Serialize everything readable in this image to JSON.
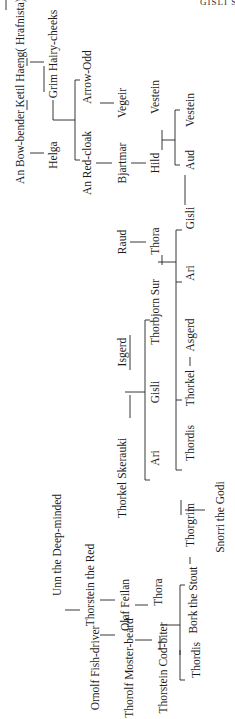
{
  "header": {
    "running_head": "GISLI SURSSON'S"
  },
  "people": [
    {
      "id": "an-bow-bender",
      "name": "An Bow-bender",
      "x": 20,
      "y": 147
    },
    {
      "id": "ketil-haeng",
      "name": "Ketil Haeng( Hrafnista)",
      "x": 20,
      "y": 53
    },
    {
      "id": "helga",
      "name": "Helga",
      "x": 53,
      "y": 155
    },
    {
      "id": "grim-hairy-cheeks",
      "name": "Grim Hairy-cheeks",
      "x": 53,
      "y": 54
    },
    {
      "id": "arrow-odd",
      "name": "Arrow-Odd",
      "x": 87,
      "y": 77
    },
    {
      "id": "an-red-cloak",
      "name": "An Red-cloak",
      "x": 87,
      "y": 163
    },
    {
      "id": "vegeir",
      "name": "Vegeir",
      "x": 122,
      "y": 103
    },
    {
      "id": "bjartmar",
      "name": "Bjartmar",
      "x": 122,
      "y": 163
    },
    {
      "id": "vestein-1",
      "name": "Vestein",
      "x": 155,
      "y": 97
    },
    {
      "id": "hild",
      "name": "Hild",
      "x": 155,
      "y": 163
    },
    {
      "id": "vestein-2",
      "name": "Vestein",
      "x": 190,
      "y": 110
    },
    {
      "id": "aud",
      "name": "Aud",
      "x": 190,
      "y": 160
    },
    {
      "id": "gisli-1",
      "name": "Gisli",
      "x": 190,
      "y": 218
    },
    {
      "id": "raud",
      "name": "Raud",
      "x": 122,
      "y": 242
    },
    {
      "id": "thora-1",
      "name": "Thora",
      "x": 155,
      "y": 241
    },
    {
      "id": "thorbjorn-sur",
      "name": "Thorbjorn Sur",
      "x": 155,
      "y": 312
    },
    {
      "id": "ari-1",
      "name": "Ari",
      "x": 190,
      "y": 273
    },
    {
      "id": "isgerd",
      "name": "Isgerd",
      "x": 122,
      "y": 352
    },
    {
      "id": "gisli-2",
      "name": "Gisli",
      "x": 155,
      "y": 392
    },
    {
      "id": "asgerd",
      "name": "Asgerd",
      "x": 190,
      "y": 335
    },
    {
      "id": "thorkel",
      "name": "Thorkel",
      "x": 190,
      "y": 388
    },
    {
      "id": "thorkel-skerauki",
      "name": "Thorkel Skerauki",
      "x": 122,
      "y": 478
    },
    {
      "id": "ari-2",
      "name": "Ari",
      "x": 155,
      "y": 458
    },
    {
      "id": "thordis-1",
      "name": "Thordis",
      "x": 190,
      "y": 443
    },
    {
      "id": "thorgrim",
      "name": "Thorgrim",
      "x": 190,
      "y": 525
    },
    {
      "id": "snorri-the-godi",
      "name": "Snorri the Godi",
      "x": 220,
      "y": 517
    },
    {
      "id": "unn-the-deep-minded",
      "name": "Unn the Deep-minded",
      "x": 57,
      "y": 545
    },
    {
      "id": "thorstein-the-red",
      "name": "Thorstein the Red",
      "x": 90,
      "y": 585
    },
    {
      "id": "olaf-feilan",
      "name": "Olaf Feilan",
      "x": 125,
      "y": 605
    },
    {
      "id": "thora-2",
      "name": "Thora",
      "x": 158,
      "y": 592
    },
    {
      "id": "bork-the-stout",
      "name": "Bork the Stout",
      "x": 193,
      "y": 600
    },
    {
      "id": "ornolf-fish-driver",
      "name": "Ornolf Fish-driver",
      "x": 95,
      "y": 668
    },
    {
      "id": "thorolf-moster-beard",
      "name": "Thorolf Moster-beard",
      "x": 129,
      "y": 668
    },
    {
      "id": "thorstein-cod-biter",
      "name": "Thorstein Cod-biter",
      "x": 163,
      "y": 668
    },
    {
      "id": "thordis-2",
      "name": "Thordis",
      "x": 196,
      "y": 660
    }
  ],
  "lines": [
    [
      6,
      0,
      6,
      10
    ],
    [
      27,
      100,
      27,
      110
    ],
    [
      27,
      58,
      27,
      66
    ],
    [
      30,
      62,
      44,
      62
    ],
    [
      30,
      153,
      44,
      153
    ],
    [
      44,
      66,
      44,
      92
    ],
    [
      53,
      120,
      53,
      100
    ],
    [
      53,
      120,
      75,
      120
    ],
    [
      75,
      80,
      75,
      160
    ],
    [
      75,
      80,
      80,
      80
    ],
    [
      75,
      160,
      80,
      160
    ],
    [
      96,
      163,
      112,
      163
    ],
    [
      100,
      103,
      114,
      103
    ],
    [
      131,
      163,
      146,
      163
    ],
    [
      162,
      130,
      162,
      150
    ],
    [
      162,
      140,
      175,
      140
    ],
    [
      175,
      110,
      175,
      165
    ],
    [
      175,
      110,
      180,
      110
    ],
    [
      175,
      165,
      180,
      165
    ],
    [
      185,
      175,
      185,
      205
    ],
    [
      130,
      242,
      146,
      242
    ],
    [
      162,
      255,
      162,
      265
    ],
    [
      158,
      262,
      176,
      262
    ],
    [
      176,
      230,
      176,
      470
    ],
    [
      176,
      230,
      182,
      230
    ],
    [
      176,
      470,
      182,
      470
    ],
    [
      176,
      282,
      182,
      282
    ],
    [
      176,
      400,
      182,
      400
    ],
    [
      190,
      357,
      190,
      366
    ],
    [
      130,
      335,
      130,
      370
    ],
    [
      130,
      395,
      130,
      418
    ],
    [
      125,
      392,
      145,
      392
    ],
    [
      145,
      320,
      145,
      480
    ],
    [
      145,
      320,
      150,
      320
    ],
    [
      145,
      480,
      150,
      480
    ],
    [
      181,
      500,
      181,
      515
    ],
    [
      185,
      510,
      205,
      510
    ],
    [
      190,
      557,
      190,
      564
    ],
    [
      160,
      637,
      160,
      650
    ],
    [
      160,
      625,
      180,
      625
    ],
    [
      180,
      650,
      180,
      655
    ],
    [
      180,
      585,
      180,
      680
    ],
    [
      180,
      585,
      185,
      585
    ],
    [
      180,
      680,
      185,
      680
    ],
    [
      100,
      635,
      115,
      635
    ],
    [
      135,
      640,
      152,
      640
    ],
    [
      65,
      610,
      80,
      610
    ],
    [
      100,
      600,
      115,
      600
    ],
    [
      135,
      605,
      148,
      605
    ]
  ]
}
